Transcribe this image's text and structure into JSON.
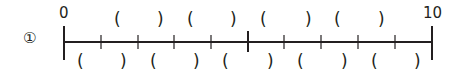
{
  "problem": {
    "number": "①",
    "start_label": "0",
    "end_label": "10",
    "min": 0,
    "max": 10,
    "divisions": 10,
    "top_blanks": [
      {
        "open": "(",
        "close": ")"
      },
      {
        "open": "(",
        "close": ")"
      },
      {
        "open": "(",
        "close": ")"
      },
      {
        "open": "(",
        "close": ")"
      }
    ],
    "bottom_blanks": [
      {
        "open": "(",
        "close": ")"
      },
      {
        "open": "(",
        "close": ")"
      },
      {
        "open": "(",
        "close": ")"
      },
      {
        "open": "(",
        "close": ")"
      },
      {
        "open": "(",
        "close": ")"
      }
    ]
  },
  "colors": {
    "ink": "#231f20"
  }
}
